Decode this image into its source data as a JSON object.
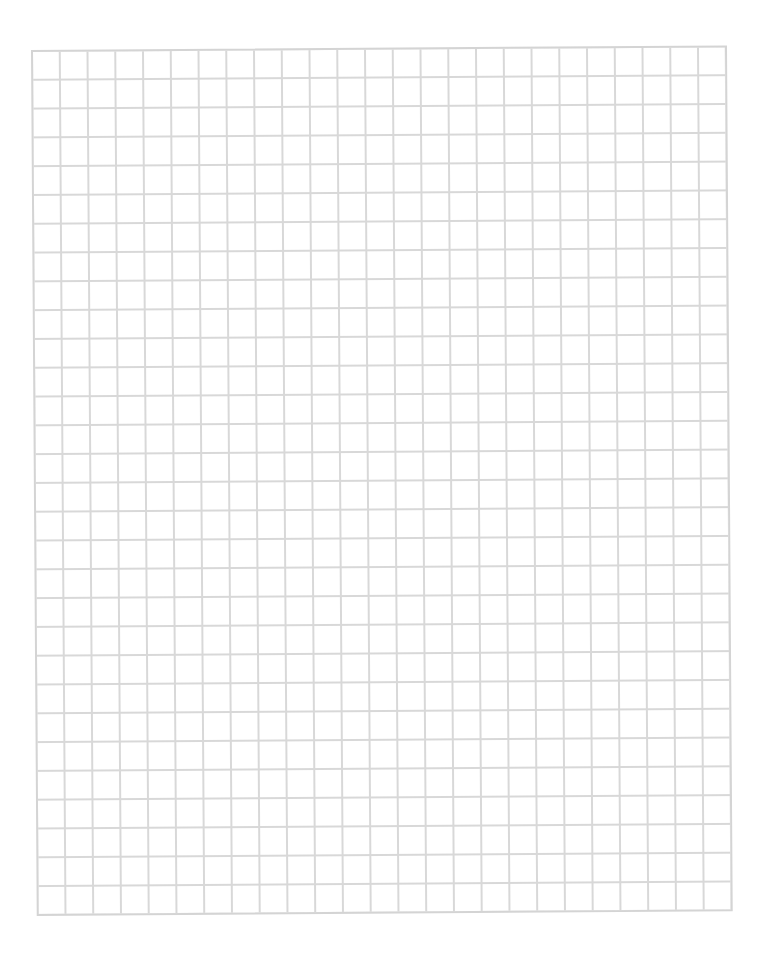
{
  "sheet": {
    "type": "graph-paper",
    "columns": 25,
    "rows": 30,
    "line_color": "#d8d8d8",
    "background_color": "#ffffff"
  }
}
